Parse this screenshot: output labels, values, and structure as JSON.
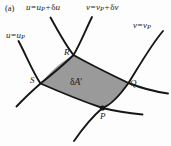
{
  "figure": {
    "panel_label": "(a)",
    "background_color": "#fdfdfd",
    "curve_color": "#161616",
    "shaded_region_color": "#9a9a9a",
    "label_color": "#1a1a1a"
  },
  "curve_labels": {
    "u_upper": {
      "var": "u",
      "equals": "=",
      "base": "u",
      "base_sub": "P",
      "plus": "+",
      "delta": "δ",
      "delta_var": "u",
      "full_text": "u = u_P + δu"
    },
    "v_upper": {
      "var": "v",
      "equals": "=",
      "base": "v",
      "base_sub": "P",
      "plus": "+",
      "delta": "δ",
      "delta_var": "v",
      "full_text": "v = v_P + δv"
    },
    "v_base": {
      "var": "v",
      "equals": "=",
      "base": "v",
      "base_sub": "P",
      "full_text": "v = v_P"
    },
    "u_base": {
      "var": "u",
      "equals": "=",
      "base": "u",
      "base_sub": "P",
      "full_text": "u = u_P"
    }
  },
  "points": {
    "P": "P",
    "Q": "Q",
    "R": "R",
    "S": "S"
  },
  "area_element": {
    "delta": "δ",
    "symbol": "A",
    "prime": "′",
    "full_text": "δA′"
  }
}
